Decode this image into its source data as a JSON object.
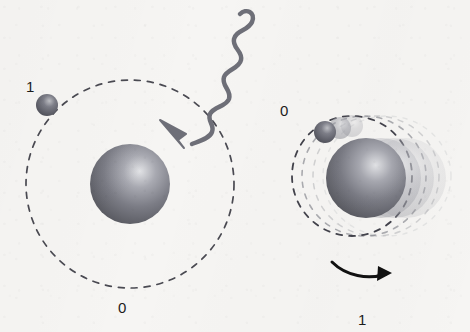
{
  "figure": {
    "background_color": "#f6f5f3",
    "ink_color": "#3c3c44",
    "label_color": "#1c1c1c"
  },
  "left_atom": {
    "name": "ground-state-atom",
    "nucleus": {
      "cx": 130,
      "cy": 184,
      "r": 40,
      "color": "#7c7d86",
      "highlight": "#d8d9dd"
    },
    "orbit": {
      "cx": 130,
      "cy": 184,
      "r": 104,
      "dash": "6 7",
      "color": "#4a4a52",
      "width": 1.7
    },
    "electron": {
      "cx": 47,
      "cy": 105,
      "r": 11,
      "color": "#5c5d68",
      "highlight": "#b9babf"
    },
    "label_top": {
      "text": "1",
      "x": 26,
      "y": 79
    },
    "label_bottom": {
      "text": "0",
      "x": 118,
      "y": 300
    }
  },
  "photon": {
    "name": "incoming-photon",
    "color": "#6e6f78",
    "width": 4.5,
    "path": "M 240 14 C 246 8, 256 12, 252 22 C 248 31, 236 30, 234 39 C 232 48, 243 51, 241 60 C 239 69, 227 69, 224 77 C 221 86, 232 90, 229 99 C 226 107, 214 106, 210 114 C 207 121, 215 125, 212 132 C 210 138, 200 141, 192 144",
    "arrow": "M 160 120 L 186 134 L 178 140 L 184 148 L 160 120 Z",
    "arrow_tip": {
      "x": 160,
      "y": 120
    }
  },
  "right_atom": {
    "name": "excited-state-atom",
    "label_top": {
      "text": "0",
      "x": 280,
      "y": 103
    },
    "label_bottom": {
      "text": "1",
      "x": 358,
      "y": 312
    },
    "orbits": [
      {
        "cx": 352,
        "cy": 176,
        "rx": 60,
        "ry": 60,
        "opacity": 1.0,
        "color": "#43434c",
        "width": 1.8,
        "dash": "6 7"
      },
      {
        "cx": 364,
        "cy": 176,
        "rx": 62,
        "ry": 60,
        "opacity": 0.55,
        "color": "#6e6f78",
        "width": 1.6,
        "dash": "5 7"
      },
      {
        "cx": 376,
        "cy": 176,
        "rx": 63,
        "ry": 60,
        "opacity": 0.34,
        "color": "#8b8c94",
        "width": 1.5,
        "dash": "5 7"
      },
      {
        "cx": 387,
        "cy": 176,
        "rx": 64,
        "ry": 60,
        "opacity": 0.2,
        "color": "#a2a3aa",
        "width": 1.4,
        "dash": "4 7"
      }
    ],
    "nuclei": [
      {
        "cx": 406,
        "cy": 178,
        "r": 40,
        "opacity": 0.18,
        "color": "#8e8f97",
        "highlight": "#dcdde0"
      },
      {
        "cx": 394,
        "cy": 178,
        "r": 40,
        "opacity": 0.26,
        "color": "#85868f",
        "highlight": "#d8d9dd"
      },
      {
        "cx": 381,
        "cy": 178,
        "r": 40,
        "opacity": 0.38,
        "color": "#7e7f88",
        "highlight": "#d5d6da"
      },
      {
        "cx": 366,
        "cy": 178,
        "r": 40,
        "opacity": 1.0,
        "color": "#6f7079",
        "highlight": "#d6d7db"
      }
    ],
    "electrons": [
      {
        "cx": 352,
        "cy": 126,
        "r": 11,
        "opacity": 0.3,
        "color": "#92939b",
        "highlight": "#d4d5d9"
      },
      {
        "cx": 340,
        "cy": 128,
        "r": 11,
        "opacity": 0.52,
        "color": "#7f8089",
        "highlight": "#c9cace"
      },
      {
        "cx": 325,
        "cy": 132,
        "r": 11,
        "opacity": 1.0,
        "color": "#5c5d68",
        "highlight": "#b9babf"
      }
    ],
    "rotation_arrow": {
      "name": "rotation-direction-arrow",
      "color": "#111111",
      "path": "M 332 262 C 346 276, 368 280, 386 274",
      "head": "M 378 266 L 392 273 L 377 281 Z"
    }
  }
}
